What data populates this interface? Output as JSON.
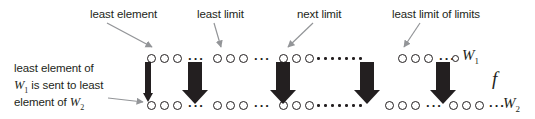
{
  "figure": {
    "ink_color": "#231f20",
    "pointer_color": "#939598"
  },
  "callouts": [
    {
      "name": "least-element",
      "text": "least element",
      "x": 90,
      "y": 8
    },
    {
      "name": "least-limit",
      "text": "least limit",
      "x": 197,
      "y": 8
    },
    {
      "name": "next-limit",
      "text": "next limit",
      "x": 297,
      "y": 8
    },
    {
      "name": "least-limit-of-limits",
      "text": "least limit of limits",
      "x": 392,
      "y": 8
    }
  ],
  "left_note": {
    "line1": "least element of",
    "line2_pre": "W",
    "line2_sub": "1",
    "line2_post": " is sent to least",
    "line3_pre": "element of ",
    "line3_var": "W",
    "line3_sub": "2",
    "x": 14,
    "y": 60
  },
  "rows": {
    "top": {
      "name": "W1",
      "label_var": "W",
      "label_sub": "1",
      "label_x": 462,
      "label_y": 47,
      "y": 52
    },
    "bottom": {
      "name": "W2",
      "label_var": "W",
      "label_sub": "2",
      "label_x": 503,
      "label_y": 95,
      "y": 99
    }
  },
  "map_label": {
    "text": "f",
    "x": 492,
    "y": 68
  },
  "top_row_items": [
    {
      "kind": "ring",
      "size": "big",
      "x": 147
    },
    {
      "kind": "ring",
      "size": "big",
      "x": 160
    },
    {
      "kind": "ring",
      "size": "big",
      "x": 173
    },
    {
      "kind": "dots",
      "x": 188,
      "text": "···"
    },
    {
      "kind": "ring",
      "size": "big",
      "x": 213
    },
    {
      "kind": "ring",
      "size": "big",
      "x": 226
    },
    {
      "kind": "ring",
      "size": "big",
      "x": 239
    },
    {
      "kind": "dots",
      "x": 254,
      "text": "···"
    },
    {
      "kind": "ring",
      "size": "big",
      "x": 279
    },
    {
      "kind": "ring",
      "size": "big",
      "x": 292
    },
    {
      "kind": "ring",
      "size": "big",
      "x": 305
    },
    {
      "kind": "tinydots",
      "x": 317,
      "count": 7,
      "gap": 7
    },
    {
      "kind": "ring",
      "size": "big",
      "x": 398
    },
    {
      "kind": "ring",
      "size": "big",
      "x": 411
    },
    {
      "kind": "ring",
      "size": "big",
      "x": 424
    },
    {
      "kind": "dots",
      "x": 439,
      "text": "···"
    },
    {
      "kind": "ring",
      "size": "sm",
      "x": 452
    }
  ],
  "bottom_row_items": [
    {
      "kind": "ring",
      "size": "big",
      "x": 147
    },
    {
      "kind": "ring",
      "size": "big",
      "x": 160
    },
    {
      "kind": "ring",
      "size": "big",
      "x": 173
    },
    {
      "kind": "dots",
      "x": 188,
      "text": "···"
    },
    {
      "kind": "ring",
      "size": "big",
      "x": 213
    },
    {
      "kind": "ring",
      "size": "big",
      "x": 226
    },
    {
      "kind": "ring",
      "size": "big",
      "x": 239
    },
    {
      "kind": "dots",
      "x": 254,
      "text": "···"
    },
    {
      "kind": "ring",
      "size": "big",
      "x": 279
    },
    {
      "kind": "ring",
      "size": "big",
      "x": 292
    },
    {
      "kind": "ring",
      "size": "big",
      "x": 305
    },
    {
      "kind": "tinydots",
      "x": 317,
      "count": 7,
      "gap": 7
    },
    {
      "kind": "ring",
      "size": "big",
      "x": 385
    },
    {
      "kind": "ring",
      "size": "big",
      "x": 398
    },
    {
      "kind": "ring",
      "size": "big",
      "x": 411
    },
    {
      "kind": "dots",
      "x": 426,
      "text": "···"
    },
    {
      "kind": "ring",
      "size": "big",
      "x": 449
    },
    {
      "kind": "ring",
      "size": "big",
      "x": 462
    },
    {
      "kind": "ring",
      "size": "big",
      "x": 475
    },
    {
      "kind": "dots",
      "x": 489,
      "text": "···"
    }
  ],
  "map_arrows": [
    {
      "name": "map-arrow-1",
      "x": 148,
      "top": 62,
      "height": 40,
      "shaft": 6,
      "head": 11,
      "headh": 9,
      "style": "thin"
    },
    {
      "name": "map-arrow-2",
      "x": 195,
      "top": 62,
      "height": 42,
      "shaft": 14,
      "head": 26,
      "headh": 14,
      "style": "block"
    },
    {
      "name": "map-arrow-3",
      "x": 283,
      "top": 62,
      "height": 42,
      "shaft": 14,
      "head": 26,
      "headh": 14,
      "style": "block"
    },
    {
      "name": "map-arrow-4",
      "x": 367,
      "top": 62,
      "height": 42,
      "shaft": 14,
      "head": 26,
      "headh": 14,
      "style": "block"
    },
    {
      "name": "map-arrow-5",
      "x": 443,
      "top": 62,
      "height": 42,
      "shaft": 14,
      "head": 26,
      "headh": 14,
      "style": "block"
    }
  ],
  "pointer_arrows": [
    {
      "name": "pointer-least-element",
      "x1": 107,
      "y1": 23,
      "x2": 152,
      "y2": 47
    },
    {
      "name": "pointer-least-limit",
      "x1": 214,
      "y1": 23,
      "x2": 221,
      "y2": 47
    },
    {
      "name": "pointer-next-limit",
      "x1": 313,
      "y1": 23,
      "x2": 288,
      "y2": 47
    },
    {
      "name": "pointer-least-limit-of-limits",
      "x1": 420,
      "y1": 23,
      "x2": 404,
      "y2": 47
    },
    {
      "name": "pointer-left-note",
      "x1": 108,
      "y1": 98,
      "x2": 143,
      "y2": 102
    }
  ]
}
